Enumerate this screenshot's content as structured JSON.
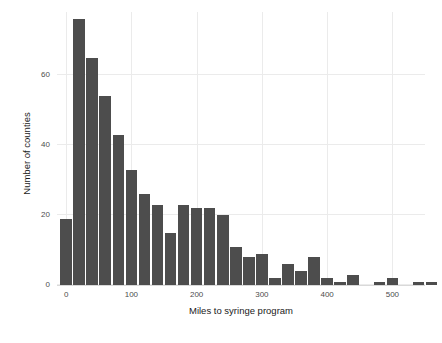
{
  "chart_data": {
    "type": "bar",
    "title": "",
    "subtitle": "",
    "xlabel": "Miles to syringe program",
    "ylabel": "Number of counties",
    "xlim": [
      -14,
      550
    ],
    "ylim": [
      0,
      78
    ],
    "xticks": [
      0,
      100,
      200,
      300,
      400,
      500
    ],
    "xtick_labels": [
      "0",
      "100",
      "200",
      "300",
      "400",
      "500"
    ],
    "yticks": [
      0,
      20,
      40,
      60
    ],
    "ytick_labels": [
      "0",
      "20",
      "40",
      "60"
    ],
    "grid": true,
    "legend": null,
    "bin_width": 20,
    "bar_color": "#4d4d4d",
    "panel_background": "#ffffff",
    "grid_color": "#ebebeb",
    "bins": [
      {
        "x0": -10,
        "x1": 10,
        "center": 0,
        "value": 19
      },
      {
        "x0": 10,
        "x1": 30,
        "center": 20,
        "value": 76
      },
      {
        "x0": 30,
        "x1": 50,
        "center": 40,
        "value": 65
      },
      {
        "x0": 50,
        "x1": 70,
        "center": 60,
        "value": 54
      },
      {
        "x0": 70,
        "x1": 90,
        "center": 80,
        "value": 43
      },
      {
        "x0": 90,
        "x1": 110,
        "center": 100,
        "value": 33
      },
      {
        "x0": 110,
        "x1": 130,
        "center": 120,
        "value": 26
      },
      {
        "x0": 130,
        "x1": 150,
        "center": 140,
        "value": 23
      },
      {
        "x0": 150,
        "x1": 170,
        "center": 160,
        "value": 15
      },
      {
        "x0": 170,
        "x1": 190,
        "center": 180,
        "value": 23
      },
      {
        "x0": 190,
        "x1": 210,
        "center": 200,
        "value": 22
      },
      {
        "x0": 210,
        "x1": 230,
        "center": 220,
        "value": 22
      },
      {
        "x0": 230,
        "x1": 250,
        "center": 240,
        "value": 20
      },
      {
        "x0": 250,
        "x1": 270,
        "center": 260,
        "value": 11
      },
      {
        "x0": 270,
        "x1": 290,
        "center": 280,
        "value": 8
      },
      {
        "x0": 290,
        "x1": 310,
        "center": 300,
        "value": 9
      },
      {
        "x0": 310,
        "x1": 330,
        "center": 320,
        "value": 2
      },
      {
        "x0": 330,
        "x1": 350,
        "center": 340,
        "value": 6
      },
      {
        "x0": 350,
        "x1": 370,
        "center": 360,
        "value": 4
      },
      {
        "x0": 370,
        "x1": 390,
        "center": 380,
        "value": 8
      },
      {
        "x0": 390,
        "x1": 410,
        "center": 400,
        "value": 2
      },
      {
        "x0": 410,
        "x1": 430,
        "center": 420,
        "value": 1
      },
      {
        "x0": 430,
        "x1": 450,
        "center": 440,
        "value": 3
      },
      {
        "x0": 470,
        "x1": 490,
        "center": 480,
        "value": 1
      },
      {
        "x0": 490,
        "x1": 510,
        "center": 500,
        "value": 2
      },
      {
        "x0": 530,
        "x1": 550,
        "center": 540,
        "value": 1
      },
      {
        "x0": 550,
        "x1": 570,
        "center": 560,
        "value": 1
      }
    ]
  }
}
